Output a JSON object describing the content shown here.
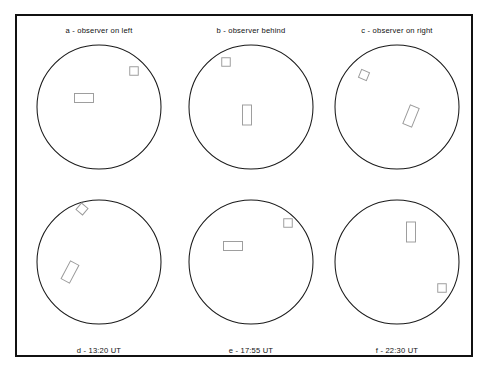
{
  "figure": {
    "type": "diagram",
    "border_color": "#111111",
    "disc_stroke_color": "#1a1a1a",
    "feature_stroke_color": "#9a9a9a",
    "background_color": "#ffffff"
  },
  "panels": [
    {
      "id": "a",
      "caption": "a - observer on left",
      "caption_position": "above",
      "disc": {
        "cx": 76,
        "cy": 70,
        "r": 62
      },
      "features": [
        {
          "name": "square",
          "cx": 111,
          "cy": 34,
          "w": 8.5,
          "h": 8.5,
          "rotation": 0
        },
        {
          "name": "rectangle",
          "cx": 61,
          "cy": 61,
          "w": 19,
          "h": 9,
          "rotation": 0
        }
      ]
    },
    {
      "id": "b",
      "caption": "b - observer behind",
      "caption_position": "above",
      "disc": {
        "cx": 76,
        "cy": 70,
        "r": 62
      },
      "features": [
        {
          "name": "square",
          "cx": 51,
          "cy": 25,
          "w": 8.5,
          "h": 8.5,
          "rotation": 0
        },
        {
          "name": "rectangle",
          "cx": 72,
          "cy": 78,
          "w": 9,
          "h": 20,
          "rotation": 0
        }
      ]
    },
    {
      "id": "c",
      "caption": "c - observer on right",
      "caption_position": "above",
      "disc": {
        "cx": 76,
        "cy": 70,
        "r": 62
      },
      "features": [
        {
          "name": "square",
          "cx": 43,
          "cy": 38,
          "w": 8.5,
          "h": 8.5,
          "rotation": 22
        },
        {
          "name": "rectangle",
          "cx": 90,
          "cy": 79,
          "w": 9.5,
          "h": 20,
          "rotation": 22
        }
      ]
    },
    {
      "id": "d",
      "caption": "d - 13:20 UT",
      "caption_position": "below",
      "disc": {
        "cx": 76,
        "cy": 72,
        "r": 62
      },
      "features": [
        {
          "name": "square",
          "cx": 59,
          "cy": 19,
          "w": 8.5,
          "h": 8.5,
          "rotation": 40
        },
        {
          "name": "rectangle",
          "cx": 47,
          "cy": 82,
          "w": 9.5,
          "h": 20,
          "rotation": 28
        }
      ]
    },
    {
      "id": "e",
      "caption": "e - 17:55 UT",
      "caption_position": "below",
      "disc": {
        "cx": 76,
        "cy": 72,
        "r": 62
      },
      "features": [
        {
          "name": "square",
          "cx": 113,
          "cy": 33,
          "w": 8.5,
          "h": 8.5,
          "rotation": 0
        },
        {
          "name": "rectangle",
          "cx": 58,
          "cy": 56,
          "w": 19,
          "h": 9,
          "rotation": 0
        }
      ]
    },
    {
      "id": "f",
      "caption": "f - 22:30 UT",
      "caption_position": "below",
      "disc": {
        "cx": 76,
        "cy": 72,
        "r": 62
      },
      "features": [
        {
          "name": "rectangle",
          "cx": 90,
          "cy": 42,
          "w": 9,
          "h": 20,
          "rotation": 0
        },
        {
          "name": "square",
          "cx": 121,
          "cy": 98,
          "w": 8.5,
          "h": 8.5,
          "rotation": 0
        }
      ]
    }
  ],
  "layout": {
    "columns": 3,
    "rows": 2,
    "column_x": [
      6,
      158,
      304
    ],
    "row_y": [
      4,
      172
    ]
  }
}
